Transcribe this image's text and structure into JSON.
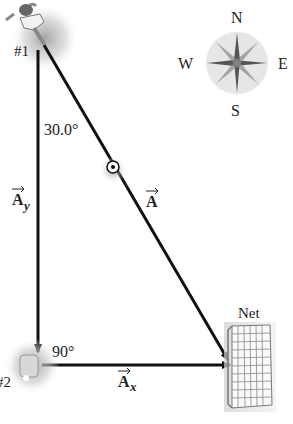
{
  "diagram": {
    "players": [
      {
        "label": "#1",
        "name": "player-1"
      },
      {
        "label": "#2",
        "name": "player-2"
      }
    ],
    "angles": {
      "top": "30.0°",
      "right_angle": "90°"
    },
    "vectors": {
      "resultant": {
        "symbol": "A",
        "subscript": ""
      },
      "y_component": {
        "symbol": "A",
        "subscript": "y"
      },
      "x_component": {
        "symbol": "A",
        "subscript": "x"
      }
    },
    "net_label": "Net",
    "compass": {
      "north": "N",
      "south": "S",
      "east": "E",
      "west": "W"
    }
  }
}
